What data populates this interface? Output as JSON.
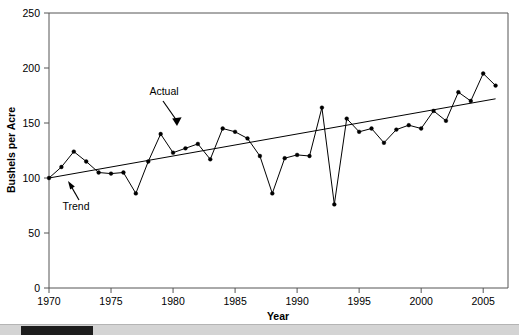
{
  "chart_data": {
    "type": "line",
    "title": "",
    "xlabel": "Year",
    "ylabel": "Bushels per Acre",
    "xlim": [
      1970,
      2007
    ],
    "ylim": [
      0,
      250
    ],
    "grid": false,
    "legend": "none",
    "xticks": [
      1970,
      1975,
      1980,
      1985,
      1990,
      1995,
      2000,
      2005
    ],
    "yticks": [
      0,
      50,
      100,
      150,
      200,
      250
    ],
    "x": [
      1970,
      1971,
      1972,
      1973,
      1974,
      1975,
      1976,
      1977,
      1978,
      1979,
      1980,
      1981,
      1982,
      1983,
      1984,
      1985,
      1986,
      1987,
      1988,
      1989,
      1990,
      1991,
      1992,
      1993,
      1994,
      1995,
      1996,
      1997,
      1998,
      1999,
      2000,
      2001,
      2002,
      2003,
      2004,
      2005,
      2006
    ],
    "series": [
      {
        "name": "Actual",
        "values": [
          100,
          110,
          124,
          115,
          105,
          104,
          105,
          86,
          115,
          140,
          123,
          127,
          131,
          117,
          145,
          142,
          136,
          120,
          86,
          118,
          121,
          120,
          164,
          76,
          154,
          142,
          145,
          132,
          144,
          148,
          145,
          161,
          152,
          178,
          170,
          195,
          184
        ]
      },
      {
        "name": "Trend",
        "values": [
          100,
          102,
          104,
          106,
          108,
          110,
          112,
          114,
          116,
          118,
          120,
          122,
          124,
          126,
          128,
          130,
          132,
          134,
          136,
          138,
          140,
          142,
          144,
          146,
          148,
          150,
          152,
          154,
          156,
          158,
          160,
          162,
          164,
          166,
          168,
          170,
          172
        ]
      }
    ],
    "annotations": [
      {
        "label": "Actual",
        "x": 1979,
        "y": 140
      },
      {
        "label": "Trend",
        "x": 1972,
        "y": 104
      }
    ],
    "colors": {
      "series_line": "#000000",
      "trend_line": "#000000",
      "axis": "#555555",
      "background": "#ffffff"
    }
  },
  "axis": {
    "x_title": "Year",
    "y_title": "Bushels per Acre",
    "x_tick_labels": [
      "1970",
      "1975",
      "1980",
      "1985",
      "1990",
      "1995",
      "2000",
      "2005"
    ],
    "y_tick_labels": [
      "0",
      "50",
      "100",
      "150",
      "200",
      "250"
    ]
  },
  "annotations": {
    "actual_label": "Actual",
    "trend_label": "Trend"
  },
  "scrollbar": {
    "orientation": "horizontal",
    "thumb_position_percent": 4
  }
}
